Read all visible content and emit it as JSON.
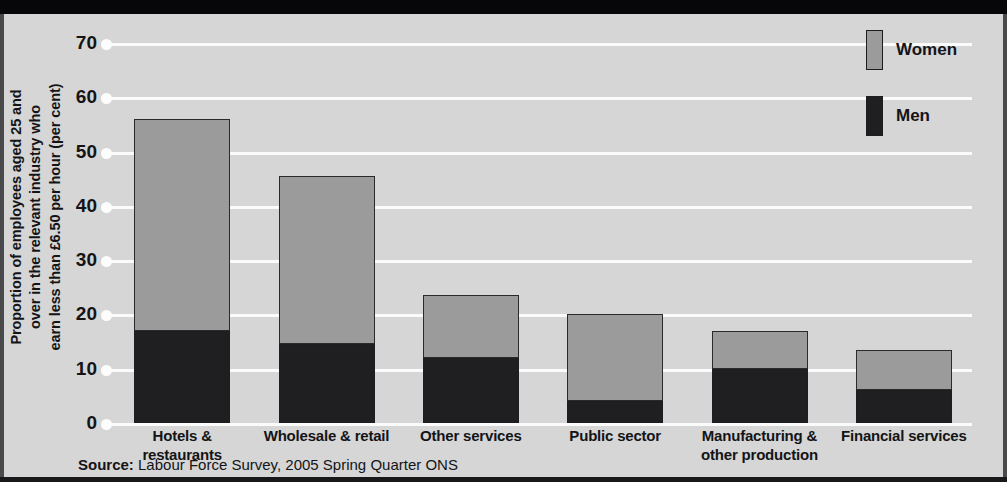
{
  "chart_data": {
    "type": "bar",
    "stacked": true,
    "title": "",
    "subtitle": "",
    "xlabel": "",
    "ylabel_lines": [
      "Proportion of employees aged 25 and",
      "over in the relevant industry who",
      "earn less than £6.50 per hour (per cent)"
    ],
    "ylabel": "Proportion of employees aged 25 and over in the relevant industry who earn less than £6.50 per hour (per cent)",
    "ylim": [
      0,
      70
    ],
    "yticks": [
      0,
      10,
      20,
      30,
      40,
      50,
      60,
      70
    ],
    "ytick_labels": [
      "0",
      "10",
      "20",
      "30",
      "40",
      "50",
      "60",
      "70"
    ],
    "grid": true,
    "legend_position": "top-right",
    "categories": [
      "Hotels & restaurants",
      "Wholesale & retail",
      "Other services",
      "Public sector",
      "Manufacturing & other production",
      "Financial services"
    ],
    "category_label_lines": [
      [
        "Hotels &",
        "restaurants"
      ],
      [
        "Wholesale & retail"
      ],
      [
        "Other services"
      ],
      [
        "Public sector"
      ],
      [
        "Manufacturing &",
        "other production"
      ],
      [
        "Financial services"
      ]
    ],
    "series": [
      {
        "name": "Men",
        "color": "#1f1f21",
        "values": [
          17.0,
          14.5,
          12.0,
          4.0,
          10.0,
          6.0
        ]
      },
      {
        "name": "Women",
        "color": "#9b9b9b",
        "values": [
          39.0,
          31.0,
          11.5,
          16.0,
          7.0,
          7.5
        ]
      }
    ],
    "totals": [
      56.0,
      45.5,
      23.5,
      20.0,
      17.0,
      13.5
    ]
  },
  "legend": {
    "entries": [
      {
        "label": "Women",
        "color": "#9b9b9b"
      },
      {
        "label": "Men",
        "color": "#1f1f21"
      }
    ]
  },
  "source": {
    "prefix": "Source:",
    "text": " Labour Force Survey, 2005 Spring Quarter ONS",
    "full": "Source: Labour Force Survey, 2005 Spring Quarter ONS"
  },
  "colors": {
    "background": "#d6d6d6",
    "gridline": "#fbfbfb",
    "ink": "#141416",
    "women": "#9b9b9b",
    "men": "#1f1f21"
  }
}
